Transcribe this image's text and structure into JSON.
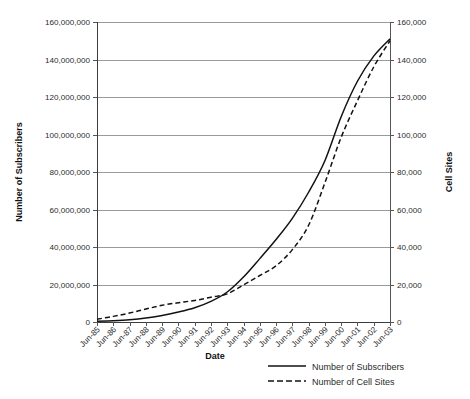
{
  "chart_data": {
    "type": "line",
    "title": "",
    "xlabel": "Date",
    "ylabel": "Number of Subscribers",
    "y2label": "Cell Sites",
    "grid": true,
    "legend_position": "bottom-right",
    "categories": [
      "Jun-85",
      "Jun-86",
      "Jun-87",
      "Jun-88",
      "Jun-89",
      "Jun-90",
      "Jun-91",
      "Jun-92",
      "Jun-93",
      "Jun-94",
      "Jun-95",
      "Jun-96",
      "Jun-97",
      "Jun-98",
      "Jun-99",
      "Jun-00",
      "Jun-01",
      "Jun-02",
      "Jun-03"
    ],
    "ylim": [
      0,
      160000000
    ],
    "yticks": [
      0,
      20000000,
      40000000,
      60000000,
      80000000,
      100000000,
      120000000,
      140000000,
      160000000
    ],
    "ytick_labels": [
      "0",
      "20,000,000",
      "40,000,000",
      "60,000,000",
      "80,000,000",
      "100,000,000",
      "120,000,000",
      "140,000,000",
      "160,000,000"
    ],
    "y2lim": [
      0,
      160000
    ],
    "y2ticks": [
      0,
      20000,
      40000,
      60000,
      80000,
      100000,
      120000,
      140000,
      160000
    ],
    "y2tick_labels": [
      "0",
      "20,000",
      "40,000",
      "60,000",
      "80,000",
      "100,000",
      "120,000",
      "140,000",
      "160,000"
    ],
    "series": [
      {
        "name": "Number of Subscribers",
        "style": "solid",
        "axis": "left",
        "color": "#121212",
        "values": [
          340000,
          680000,
          1200000,
          2100000,
          3500000,
          5300000,
          7600000,
          11000000,
          16000000,
          24000000,
          33800000,
          44000000,
          55300000,
          69200000,
          86000000,
          109500000,
          128400000,
          141800000,
          151000000
        ]
      },
      {
        "name": "Number of Cell Sites",
        "style": "dashed",
        "axis": "right",
        "color": "#121212",
        "values": [
          1500,
          3000,
          4800,
          6900,
          8900,
          10300,
          11500,
          13200,
          15000,
          19800,
          24800,
          30000,
          38600,
          51600,
          74200,
          98500,
          118000,
          136000,
          150000
        ]
      }
    ],
    "legend": [
      {
        "label": "Number of Subscribers",
        "style": "solid"
      },
      {
        "label": "Number of Cell Sites",
        "style": "dashed"
      }
    ]
  }
}
